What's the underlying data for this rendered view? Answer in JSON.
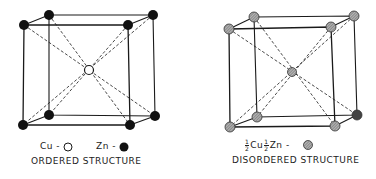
{
  "figures": [
    {
      "id": "ordered",
      "title": "ORDERED STRUCTURE",
      "legend": [
        {
          "label": "Cu -",
          "symbol": "open-circle"
        },
        {
          "label": "Zn -",
          "symbol": "filled-circle"
        }
      ],
      "corner_atom": "Zn",
      "center_atom": "Cu"
    },
    {
      "id": "disordered",
      "title": "DISORDERED STRUCTURE",
      "legend": [
        {
          "label": "Cu",
          "prefix_fraction": "1/2",
          "label2": "Zn -",
          "prefix_fraction2": "1/2",
          "symbol": "hatched-circle"
        }
      ],
      "corner_atom": "1/2 Cu 1/2 Zn",
      "center_atom": "1/2 Cu 1/2 Zn"
    }
  ],
  "fractions": {
    "num": "1",
    "den": "2"
  },
  "colors": {
    "line": "#1a1a1a",
    "filled": "#111111",
    "hatched": "#8a8a8a",
    "open": "#ffffff"
  }
}
